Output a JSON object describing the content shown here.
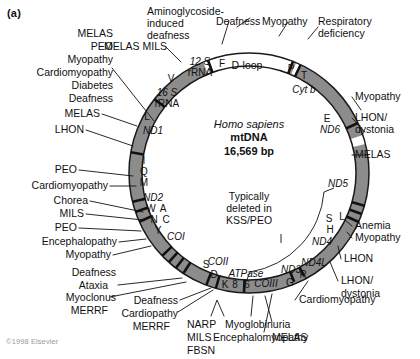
{
  "figure": {
    "panel_label": "(a)",
    "copyright": "©1998 Elsevier",
    "center": {
      "species": "Homo sapiens",
      "molecule": "mtDNA",
      "size": "16,569 bp"
    },
    "deletion_note": {
      "line1": "Typically",
      "line2": "deleted in",
      "line3": "KSS/PEO"
    }
  },
  "genes": {
    "rrna_12s": "12 S\nrRNA",
    "rrna_12s_l1": "12 S",
    "rrna_12s_l2": "rRNA",
    "rrna_16s_l1": "16 S",
    "rrna_16s_l2": "rRNA",
    "dloop": "D-loop",
    "nd1": "ND1",
    "nd2": "ND2",
    "nd3": "ND3",
    "nd4": "ND4",
    "nd4l": "ND4L",
    "nd5": "ND5",
    "nd6": "ND6",
    "coi": "COI",
    "coii": "COII",
    "coiii": "COIII",
    "cytb": "Cyt b",
    "atpase": "ATPase",
    "atpase_8": "8",
    "atpase_6": "6"
  },
  "trna": {
    "F": "F",
    "V": "V",
    "L_16s": "L",
    "I": "I",
    "Q": "Q",
    "M": "M",
    "W": "W",
    "A": "A",
    "N": "N",
    "C": "C",
    "Y": "Y",
    "S_coi": "S",
    "D": "D",
    "K": "K",
    "G": "G",
    "R": "R",
    "S_nd5": "S",
    "H": "H",
    "L_nd5": "L",
    "E": "E",
    "T": "T",
    "P": "P"
  },
  "diseases": {
    "top_left_stack": [
      "MELAS",
      "PEO",
      "Myopathy",
      "Cardiomyopathy",
      "Diabetes",
      "Deafness"
    ],
    "melas_mils": "MELAS MILS",
    "aminoglycoside": [
      "Aminoglycoside-",
      "induced",
      "deafness"
    ],
    "deafness_top": "Deafness",
    "myopathy_top": "Myopathy",
    "respiratory": [
      "Respiratory",
      "deficiency"
    ],
    "melas_nd1": "MELAS",
    "lhon_nd1": "LHON",
    "peo_iqm": "PEO",
    "cardiomyopathy_iqm": "Cardiomyopathy",
    "chorea": "Chorea",
    "mils_wancy": "MILS",
    "peo_wancy": "PEO",
    "encephalopathy_wancy": "Encephalopathy",
    "myopathy_wancy": "Myopathy",
    "deafness_sd": "Deafness",
    "ataxia": "Ataxia",
    "myoclonus": "Myoclonus",
    "merrf_sd": "MERRF",
    "deafness_k": "Deafness",
    "cardiopathy_k": "Cardiopathy",
    "merrf_k": "MERRF",
    "narp": "NARP",
    "mils_atpase": "MILS",
    "fbsn": "FBSN",
    "myoglobinuria": "Myoglobinuria",
    "encephalomyopathy": "Encephalomyopathy",
    "melas_coiii": "MELAS",
    "cardiomyopathy_gr": "Cardiomyopathy",
    "lhon_dystonia_nd4": [
      "LHON/",
      "dystonia"
    ],
    "lhon_nd4": "LHON",
    "anemia": "Anemia",
    "myopathy_slh": "Myopathy",
    "melas_nd5": "MELAS",
    "lhon_dystonia_nd6": [
      "LHON/",
      "dystonia"
    ],
    "myopathy_nd6": "Myopathy"
  },
  "colors": {
    "ring_fill": "#8c8c8c",
    "ring_stroke": "#1a1a1a",
    "tick": "#111111",
    "dloop_fill": "#ffffff",
    "text": "#111111",
    "copyright": "#9a9a9a"
  }
}
